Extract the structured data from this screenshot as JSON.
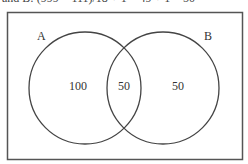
{
  "caption_cropped": "and B: (999 − 111)/18 + 1 = 49 + 1 = 50",
  "diagram": {
    "type": "venn",
    "universe_border_color": "#555555",
    "circle_stroke_color": "#444444",
    "sets": [
      {
        "label": "A",
        "only_value": "100"
      },
      {
        "label": "B",
        "only_value": "50"
      }
    ],
    "intersection_value": "50"
  }
}
